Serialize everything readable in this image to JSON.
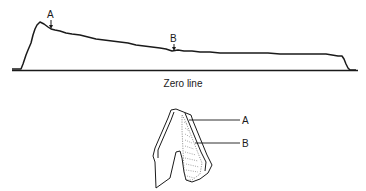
{
  "figure": {
    "trace": {
      "marker_a": "A",
      "marker_b": "B",
      "baseline_label": "Zero line"
    },
    "section": {
      "label_a": "A",
      "label_b": "B"
    }
  },
  "colors": {
    "ink": "#1a1a1a",
    "background": "#ffffff"
  }
}
